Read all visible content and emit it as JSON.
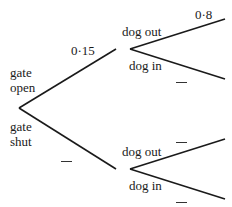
{
  "diagram": {
    "type": "probability-tree",
    "line_color": "#1a1a1a",
    "first_level": {
      "labels": {
        "gate_open_line1": "gate",
        "gate_open_line2": "open",
        "gate_shut_line1": "gate",
        "gate_shut_line2": "shut"
      },
      "probabilities": {
        "gate_open": "0·15",
        "gate_shut": ""
      }
    },
    "second_level": {
      "after_open": {
        "dog_out_label": "dog out",
        "dog_in_label": "dog in",
        "dog_out_prob": "0·8",
        "dog_in_prob": ""
      },
      "after_shut": {
        "dog_out_label": "dog out",
        "dog_in_label": "dog in",
        "dog_out_prob": "",
        "dog_in_prob": ""
      }
    }
  }
}
